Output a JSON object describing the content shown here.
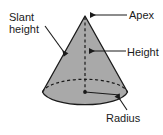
{
  "figure": {
    "shape": "cone",
    "fill_color": "#a9a9a9",
    "stroke_color": "#1a1a1a",
    "background_color": "#ffffff"
  },
  "labels": {
    "slant_height_line1": "Slant",
    "slant_height_line2": "height",
    "apex": "Apex",
    "height": "Height",
    "radius": "Radius"
  },
  "geometry": {
    "apex_x": 85,
    "apex_y": 16,
    "base_center_x": 85,
    "base_center_y": 92,
    "base_rx": 43,
    "base_ry": 15
  }
}
